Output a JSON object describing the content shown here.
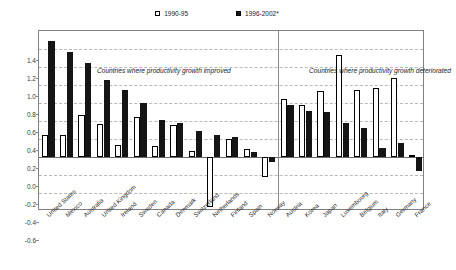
{
  "legend": {
    "entries": [
      {
        "label": "1990-95",
        "style": "open",
        "icon": "open-square-icon"
      },
      {
        "label": "1996-2002*",
        "style": "filled",
        "icon": "filled-square-icon"
      }
    ]
  },
  "annotations": {
    "left": "Countries where productivity growth improved",
    "right": "Countries where productivity growth deteriorated"
  },
  "chart_data": {
    "type": "bar",
    "title": "",
    "subtitle": "",
    "xlabel": "",
    "ylabel": "",
    "ylim": [
      -0.6,
      1.4
    ],
    "ytick_step": 0.2,
    "yticks": [
      "1.4",
      "1.2",
      "1.0",
      "0.8",
      "0.6",
      "0.4",
      "0.2",
      "0.0",
      "-0.2",
      "-0.4",
      "-0.6"
    ],
    "ytick_values": [
      1.4,
      1.2,
      1.0,
      0.8,
      0.6,
      0.4,
      0.2,
      0.0,
      -0.2,
      -0.4,
      -0.6
    ],
    "grid": true,
    "legend_position": "top-center",
    "divider_after_category": "Norway",
    "categories": [
      "United States",
      "Mexico",
      "Australia",
      "United Kingdom",
      "Ireland",
      "Sweden",
      "Canada",
      "Denmark",
      "Switzerland",
      "Netherlands",
      "Finland",
      "Spain",
      "Norway",
      "Austria",
      "Korea",
      "Japan",
      "Luxembourg",
      "Belgium",
      "Italy",
      "Germany",
      "France"
    ],
    "series": [
      {
        "name": "1990-95",
        "style": "open",
        "values": [
          0.24,
          0.24,
          0.47,
          0.37,
          0.13,
          0.45,
          0.12,
          0.36,
          0.07,
          -0.55,
          0.2,
          0.09,
          -0.22,
          0.65,
          0.58,
          0.73,
          1.13,
          0.75,
          0.77,
          0.88,
          0.02
        ]
      },
      {
        "name": "1996-2002*",
        "style": "filled",
        "values": [
          1.29,
          1.17,
          1.05,
          0.86,
          0.74,
          0.6,
          0.41,
          0.38,
          0.29,
          0.24,
          0.22,
          0.06,
          -0.06,
          0.58,
          0.51,
          0.5,
          0.38,
          0.32,
          0.1,
          0.16,
          -0.15
        ]
      }
    ],
    "groups": [
      {
        "label": "Countries where productivity growth improved",
        "from": "United States",
        "to": "Norway"
      },
      {
        "label": "Countries where productivity growth deteriorated",
        "from": "Austria",
        "to": "France"
      }
    ]
  }
}
